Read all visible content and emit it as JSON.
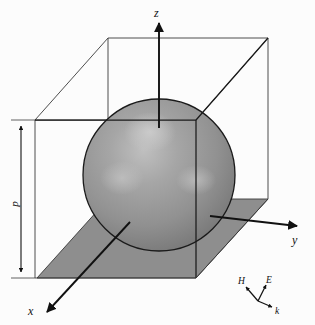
{
  "figure": {
    "background_color": "#fcfcfc",
    "width": 315,
    "height": 325
  },
  "axes": {
    "z": {
      "label": "z",
      "direction": "up",
      "arrow": true
    },
    "y": {
      "label": "y",
      "direction": "right",
      "arrow": true
    },
    "x": {
      "label": "x",
      "direction": "lower-left",
      "arrow": true
    }
  },
  "dimension": {
    "label": "p",
    "orientation": "vertical",
    "arrows": "both-ends",
    "description": "cell edge length"
  },
  "triad": {
    "H": {
      "label": "H",
      "direction": "upper-left"
    },
    "E": {
      "label": "E",
      "direction": "upper-right"
    },
    "k": {
      "label": "k",
      "direction": "lower-right"
    }
  },
  "objects": {
    "sphere": {
      "name": "sphere",
      "fill": "#8e8e8e",
      "highlight": "#c9c9c9",
      "stroke": "#1a1a1a",
      "center_x": 159,
      "center_y": 175,
      "radius": 76
    },
    "cube": {
      "name": "wireframe-cube",
      "stroke": "#3a3a3a",
      "fill": "none"
    },
    "ground_plane": {
      "name": "ground-plane",
      "fill": "#8e8e8e",
      "stroke": "#3a3a3a"
    }
  },
  "colors": {
    "ink": "#111111",
    "line": "#3a3a3a",
    "gray_fill": "#8e8e8e",
    "gray_light": "#c9c9c9",
    "background": "#fcfcfc"
  }
}
